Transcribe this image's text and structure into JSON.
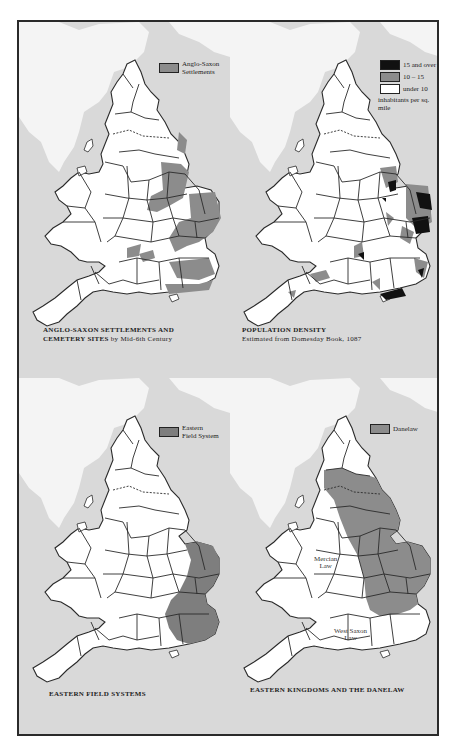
{
  "colors": {
    "sea": "#d9d9d9",
    "scotland_land": "#f4f4f4",
    "land": "#ffffff",
    "border": "#2a2a2a",
    "shaded": "#8c8c8c",
    "dark": "#111111"
  },
  "panels": [
    {
      "id": "anglo-saxon",
      "legend": [
        {
          "swatch": "#8c8c8c",
          "label_line1": "Anglo-Saxon",
          "label_line2": "Settlements"
        }
      ],
      "caption": {
        "title": "ANGLO-SAXON SETTLEMENTS AND",
        "line2_bold": "CEMETERY SITES",
        "line2_rest": " by Mid-6th Century"
      }
    },
    {
      "id": "population-density",
      "legend": [
        {
          "swatch": "#111111",
          "label": "15 and over"
        },
        {
          "swatch": "#8c8c8c",
          "label": "10 – 15"
        },
        {
          "swatch": "#ffffff",
          "label": "under 10"
        }
      ],
      "legend_note": "inhabitants per sq. mile",
      "caption": {
        "title": "POPULATION DENSITY",
        "subtitle": "Estimated from Domesday Book, 1087"
      }
    },
    {
      "id": "eastern-field-systems",
      "legend": [
        {
          "swatch": "#7e7e7e",
          "label_line1": "Eastern",
          "label_line2": "Field System"
        }
      ],
      "caption": {
        "title": "EASTERN FIELD SYSTEMS"
      }
    },
    {
      "id": "danelaw",
      "legend": [
        {
          "swatch": "#8c8c8c",
          "label": "Danelaw"
        }
      ],
      "map_labels": [
        {
          "line1": "Mercian",
          "line2": "Law"
        },
        {
          "line1": "West Saxon",
          "line2": "Law"
        }
      ],
      "caption": {
        "title": "EASTERN KINGDOMS AND THE DANELAW"
      }
    }
  ]
}
